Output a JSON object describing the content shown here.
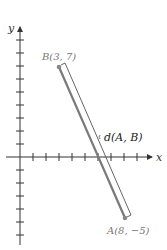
{
  "figure": {
    "axes": {
      "x_label": "x",
      "y_label": "y",
      "x_ticks": [
        1,
        2,
        3,
        4,
        5,
        6,
        7,
        8,
        9
      ],
      "y_ticks": [
        -5,
        -4,
        -3,
        -2,
        -1,
        1,
        2,
        3,
        4,
        5,
        6,
        7,
        8,
        9
      ]
    },
    "points": {
      "A": {
        "label": "A(8, −5)",
        "x": 8,
        "y": -5
      },
      "B": {
        "label": "B(3, 7)",
        "x": 3,
        "y": 7
      }
    },
    "distance_label": "d(A, B)",
    "colors": {
      "axis": "#333333",
      "segment": "#7a7a7a",
      "point": "#888888",
      "bracket": "#555555",
      "label_gray": "#777777",
      "label_dark": "#222222"
    }
  }
}
